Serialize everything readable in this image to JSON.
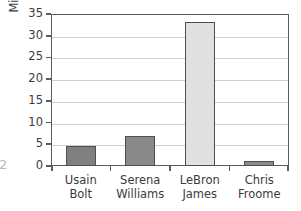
{
  "chart_data": {
    "type": "bar",
    "title": "",
    "subtitle": "",
    "xlabel": "",
    "ylabel": "Millions of followers",
    "categories": [
      "Usain Bolt",
      "Serena Williams",
      "LeBron James",
      "Chris Froome"
    ],
    "category_lines": [
      [
        "Usain",
        "Bolt"
      ],
      [
        "Serena",
        "Williams"
      ],
      [
        "LeBron",
        "James"
      ],
      [
        "Chris",
        "Froome"
      ]
    ],
    "values": [
      4.5,
      7.0,
      33.2,
      1.2
    ],
    "ylim": [
      0,
      35
    ],
    "ytick_values": [
      0,
      5,
      10,
      15,
      20,
      25,
      30,
      35
    ],
    "ytick_labels": [
      "0",
      "5",
      "10",
      "15",
      "20",
      "25",
      "30",
      "35"
    ],
    "grid": true,
    "legend": false,
    "legend_position": "none",
    "bar_colors": [
      "#808080",
      "#8a8a8a",
      "#e0e0e0",
      "#8a8a8a"
    ],
    "bar_edge_color": "#4f4f4f",
    "frame_color": "#5c5c5c",
    "grid_color": "#cfcfcf",
    "text_color": "#3b3b3b"
  },
  "artifacts": {
    "edge_glyph": "2"
  }
}
